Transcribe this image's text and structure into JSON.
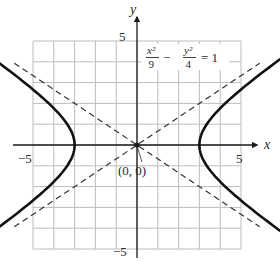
{
  "chart_data": {
    "type": "line",
    "title": "",
    "equation": {
      "lhs_term1_num": "x²",
      "lhs_term1_den": "9",
      "operator": "−",
      "lhs_term2_num": "y²",
      "lhs_term2_den": "4",
      "rhs": "= 1"
    },
    "xlabel": "x",
    "ylabel": "y",
    "xlim": [
      -5,
      5
    ],
    "ylim": [
      -5,
      5
    ],
    "grid": true,
    "grid_step": 1,
    "tick_labels": {
      "x_neg": "−5",
      "x_pos": "5",
      "y_pos": "5",
      "y_neg": "−5"
    },
    "center_label": "(0, 0)",
    "center": [
      0,
      0
    ],
    "series": [
      {
        "name": "hyperbola right branch",
        "style": "solid-thick-arrows",
        "equation": "x^2/9 - y^2/4 = 1, x>0",
        "vertex": [
          3,
          0
        ],
        "x_range": [
          3,
          5.4
        ]
      },
      {
        "name": "hyperbola left branch",
        "style": "solid-thick-arrows",
        "equation": "x^2/9 - y^2/4 = 1, x<0",
        "vertex": [
          -3,
          0
        ],
        "x_range": [
          -5.4,
          -3
        ]
      },
      {
        "name": "asymptote y = 2/3 x",
        "style": "dashed",
        "slope": 0.6667
      },
      {
        "name": "asymptote y = -2/3 x",
        "style": "dashed",
        "slope": -0.6667
      }
    ]
  },
  "colors": {
    "grid": "#bdbdbd",
    "axis": "#1a1a1a",
    "curve": "#111111",
    "asymptote": "#333333",
    "text": "#2b2b2b"
  }
}
